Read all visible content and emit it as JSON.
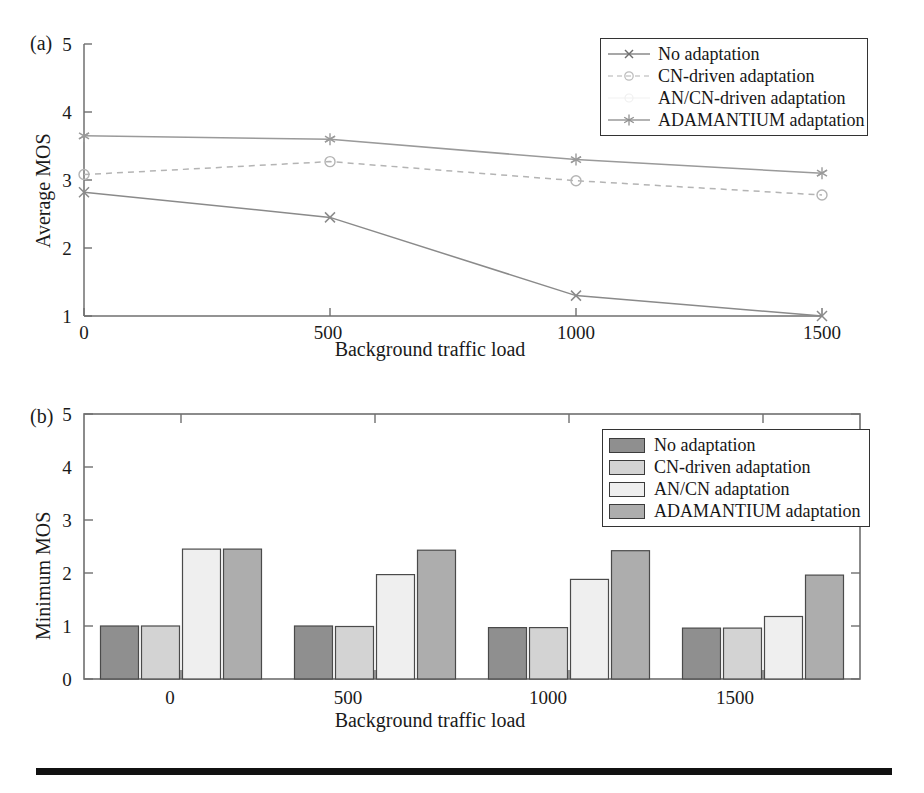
{
  "figure": {
    "panel_a_tag": "(a)",
    "panel_b_tag": "(b)"
  },
  "chart_data": [
    {
      "id": "panel-a",
      "type": "line",
      "title": "",
      "panel_label": "(a)",
      "xlabel": "Background traffic load",
      "ylabel": "Average MOS",
      "x": [
        0,
        500,
        1000,
        1500
      ],
      "xticklabels": [
        "0",
        "500",
        "1000",
        "1500"
      ],
      "yticklabels": [
        "1",
        "2",
        "3",
        "4",
        "5"
      ],
      "xlim": [
        0,
        1500
      ],
      "ylim": [
        1,
        5
      ],
      "grid": false,
      "legend_position": "top-right",
      "series": [
        {
          "name": "No adaptation",
          "marker": "x",
          "linestyle": "solid",
          "color": "#8a8a8a",
          "values": [
            2.82,
            2.45,
            1.3,
            1.0
          ]
        },
        {
          "name": "CN-driven adaptation",
          "marker": "circle",
          "linestyle": "dashed",
          "color": "#b4b4b4",
          "values": [
            3.08,
            3.27,
            2.99,
            2.78
          ]
        },
        {
          "name": "AN/CN-driven adaptation",
          "marker": "none",
          "linestyle": "none",
          "color": "#ededed",
          "values": [
            null,
            null,
            null,
            null
          ]
        },
        {
          "name": "ADAMANTIUM adaptation",
          "marker": "star",
          "linestyle": "solid",
          "color": "#9a9a9a",
          "values": [
            3.65,
            3.6,
            3.3,
            3.1
          ]
        }
      ]
    },
    {
      "id": "panel-b",
      "type": "bar",
      "title": "",
      "panel_label": "(b)",
      "xlabel": "Background traffic load",
      "ylabel": "Minimum MOS",
      "categories": [
        "0",
        "500",
        "1000",
        "1500"
      ],
      "xticklabels": [
        "0",
        "500",
        "1000",
        "1500"
      ],
      "yticklabels": [
        "0",
        "1",
        "2",
        "3",
        "4",
        "5"
      ],
      "ylim": [
        0,
        5
      ],
      "grid": false,
      "legend_position": "top-right",
      "series": [
        {
          "name": "No adaptation",
          "color": "#8f8f8f",
          "values": [
            1.0,
            1.0,
            0.97,
            0.96
          ]
        },
        {
          "name": "CN-driven adaptation",
          "color": "#d3d3d3",
          "values": [
            1.0,
            0.99,
            0.97,
            0.96
          ]
        },
        {
          "name": "AN/CN adaptation",
          "color": "#efefef",
          "values": [
            2.45,
            1.97,
            1.88,
            1.18
          ]
        },
        {
          "name": "ADAMANTIUM adaptation",
          "color": "#adadad",
          "values": [
            2.45,
            2.43,
            2.42,
            1.96
          ]
        }
      ]
    }
  ]
}
